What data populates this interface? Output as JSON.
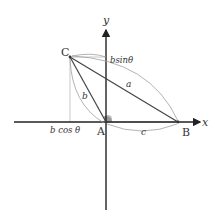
{
  "diagram": {
    "axes": {
      "x_label": "x",
      "y_label": "y"
    },
    "points": {
      "A": {
        "label": "A",
        "x": 106,
        "y": 122
      },
      "B": {
        "label": "B",
        "x": 178,
        "y": 122
      },
      "C": {
        "label": "C",
        "x": 70,
        "y": 57
      }
    },
    "sides": {
      "a": "a",
      "b": "b",
      "c": "c"
    },
    "projections": {
      "horizontal": "b cos θ",
      "vertical": "bsinθ"
    },
    "angle": {
      "name": "θ",
      "vertex": "A",
      "color": "#777777"
    },
    "colors": {
      "axis": "#222222",
      "triangle": "#444444",
      "guide": "#aaaaaa",
      "brace": "#999999",
      "label": "#333333"
    }
  }
}
